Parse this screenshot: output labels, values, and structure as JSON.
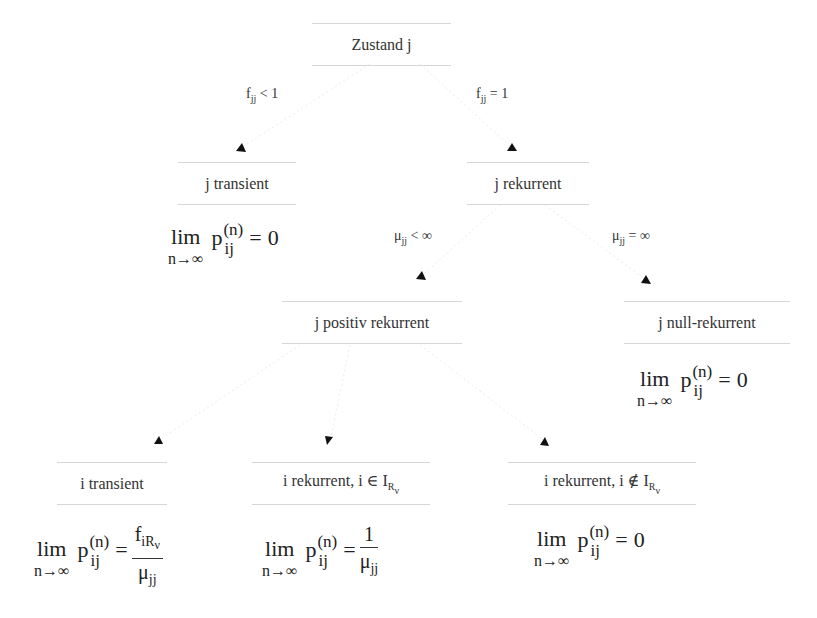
{
  "diagram": {
    "type": "decision-tree",
    "colors": {
      "text": "#333333",
      "node_border": "#d6d6d6",
      "edge": "#e6e6e6",
      "arrowhead": "#111111"
    },
    "nodes": {
      "root": {
        "label": "Zustand j"
      },
      "j_transient": {
        "label": "j transient"
      },
      "j_rekurrent": {
        "label": "j rekurrent"
      },
      "j_positiv": {
        "label": "j positiv rekurrent"
      },
      "j_null": {
        "label": "j null-rekurrent"
      },
      "i_transient": {
        "label": "i transient"
      },
      "i_rek_in": {
        "label_main": "i rekurrent, i ∈ I",
        "label_sub": "R",
        "label_subsub": "ν"
      },
      "i_rek_notin": {
        "label_main": "i rekurrent, i ∉ I",
        "label_sub": "R",
        "label_subsub": "ν"
      }
    },
    "edge_labels": {
      "fjj_lt_1": {
        "base": "f",
        "sub": "jj",
        "rel": " < 1"
      },
      "fjj_eq_1": {
        "base": "f",
        "sub": "jj",
        "rel": " = 1"
      },
      "mu_lt_inf": {
        "base": "μ",
        "sub": "jj",
        "rel": " < ∞"
      },
      "mu_eq_inf": {
        "base": "μ",
        "sub": "jj",
        "rel": " = ∞"
      }
    },
    "formulas": {
      "common": {
        "lim": "lim",
        "lim_sub": "n→∞",
        "p": "p",
        "p_sup": "(n)",
        "p_sub": "ij",
        "eq": "="
      },
      "j_transient": {
        "rhs": "0"
      },
      "j_null": {
        "rhs": "0"
      },
      "i_transient": {
        "num_base": "f",
        "num_sub": "iR",
        "num_subsub": "ν",
        "den_base": "μ",
        "den_sub": "jj"
      },
      "i_rek_in": {
        "num": "1",
        "den_base": "μ",
        "den_sub": "jj"
      },
      "i_rek_notin": {
        "rhs": "0"
      }
    }
  }
}
